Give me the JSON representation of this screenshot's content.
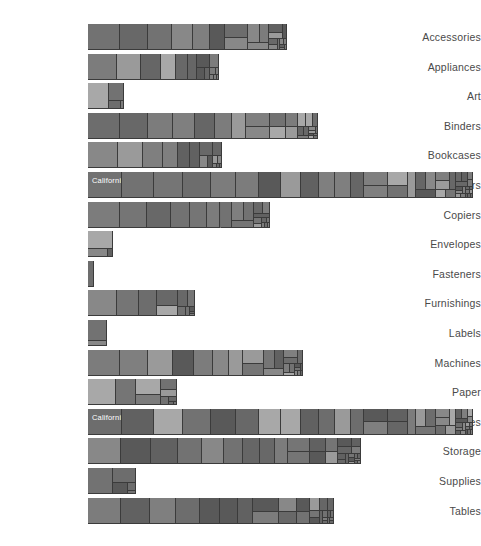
{
  "view": {
    "type": "treemap-bar-matrix",
    "background": "#ffffff",
    "label_color": "#4a4a4a",
    "cell_border_color": "#3b3b3b",
    "cell_label_color": "#ffffff",
    "plot_left_px": 88,
    "plot_max_right_px": 473
  },
  "chart_data": {
    "type": "bar",
    "title": "",
    "subtitle": "",
    "xlabel": "",
    "ylabel": "",
    "grid": false,
    "legend_position": "none",
    "orientation": "horizontal",
    "categories": [
      "Accessories",
      "Appliances",
      "Art",
      "Binders",
      "Bookcases",
      "Chairs",
      "Copiers",
      "Envelopes",
      "Fasteners",
      "Furnishings",
      "Labels",
      "Machines",
      "Paper",
      "Phones",
      "Storage",
      "Supplies",
      "Tables"
    ],
    "values": [
      199,
      131,
      36,
      230,
      134,
      385,
      182,
      25,
      6,
      107,
      19,
      215,
      89,
      385,
      273,
      48,
      246
    ],
    "xlim": [
      0,
      385
    ],
    "note": "each bar is subdivided as a treemap of state segments; widest bars (Chairs, Phones) span full plot width",
    "series": [
      {
        "name": "Segment widths per category (px of bar)",
        "rows": [
          {
            "category": "Accessories",
            "width": 199,
            "labels": [
              "California"
            ]
          },
          {
            "category": "Appliances",
            "width": 131,
            "labels": []
          },
          {
            "category": "Art",
            "width": 36,
            "labels": []
          },
          {
            "category": "Binders",
            "width": 230,
            "labels": []
          },
          {
            "category": "Bookcases",
            "width": 134,
            "labels": []
          },
          {
            "category": "Chairs",
            "width": 385,
            "labels": [
              "California",
              "New York",
              "Texas"
            ]
          },
          {
            "category": "Copiers",
            "width": 182,
            "labels": []
          },
          {
            "category": "Envelopes",
            "width": 25,
            "labels": []
          },
          {
            "category": "Fasteners",
            "width": 6,
            "labels": []
          },
          {
            "category": "Furnishings",
            "width": 107,
            "labels": []
          },
          {
            "category": "Labels",
            "width": 19,
            "labels": []
          },
          {
            "category": "Machines",
            "width": 215,
            "labels": [
              "New York"
            ]
          },
          {
            "category": "Paper",
            "width": 89,
            "labels": []
          },
          {
            "category": "Phones",
            "width": 385,
            "labels": [
              "California",
              "New York",
              "Texas"
            ]
          },
          {
            "category": "Storage",
            "width": 273,
            "labels": [
              "California"
            ]
          },
          {
            "category": "Supplies",
            "width": 48,
            "labels": []
          },
          {
            "category": "Tables",
            "width": 246,
            "labels": [
              "California"
            ]
          }
        ]
      }
    ]
  },
  "labels": {
    "accessories": "Accessories",
    "appliances": "Appliances",
    "art": "Art",
    "binders": "Binders",
    "bookcases": "Bookcases",
    "chairs": "Chairs",
    "copiers": "Copiers",
    "envelopes": "Envelopes",
    "fasteners": "Fasteners",
    "furnishings": "Furnishings",
    "labels": "Labels",
    "machines": "Machines",
    "paper": "Paper",
    "phones": "Phones",
    "storage": "Storage",
    "supplies": "Supplies",
    "tables": "Tables"
  },
  "segment_labels": {
    "california": "California",
    "new_york": "New York",
    "texas": "Texas"
  }
}
